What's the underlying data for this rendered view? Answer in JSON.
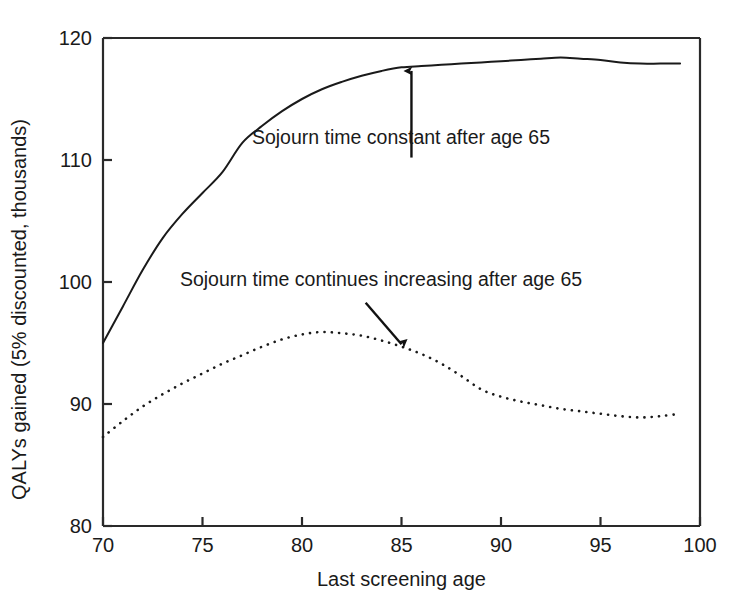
{
  "chart_data": {
    "type": "line",
    "title": "",
    "xlabel": "Last screening age",
    "ylabel": "QALYs gained (5% discounted, thousands)",
    "xlim": [
      70,
      100
    ],
    "ylim": [
      80,
      120
    ],
    "xticks": [
      70,
      75,
      80,
      85,
      90,
      95,
      100
    ],
    "yticks": [
      80,
      90,
      100,
      110,
      120
    ],
    "xtick_labels": [
      "70",
      "75",
      "80",
      "85",
      "90",
      "95",
      "100"
    ],
    "ytick_labels": [
      "80",
      "90",
      "100",
      "110",
      "120"
    ],
    "grid": false,
    "legend": "none (inline annotations with arrows)",
    "series": [
      {
        "name": "Sojourn time constant after age 65",
        "style": "solid",
        "color": "#1a1a1a",
        "x": [
          70,
          71,
          72,
          73,
          74,
          75,
          76,
          77,
          78,
          79,
          80,
          81,
          82,
          83,
          84,
          85,
          86,
          87,
          88,
          89,
          90,
          91,
          92,
          93,
          94,
          95,
          96,
          97,
          98,
          99
        ],
        "values": [
          95.0,
          98.0,
          101.0,
          103.6,
          105.6,
          107.3,
          109.0,
          111.4,
          112.8,
          114.0,
          115.0,
          115.8,
          116.4,
          116.9,
          117.3,
          117.6,
          117.7,
          117.8,
          117.9,
          118.0,
          118.1,
          118.2,
          118.3,
          118.4,
          118.3,
          118.2,
          118.0,
          117.9,
          117.9,
          117.9
        ]
      },
      {
        "name": "Sojourn time continues increasing after age 65",
        "style": "dotted",
        "color": "#1a1a1a",
        "x": [
          70,
          71,
          72,
          73,
          74,
          75,
          76,
          77,
          78,
          79,
          80,
          81,
          82,
          83,
          84,
          85,
          86,
          87,
          88,
          89,
          90,
          91,
          92,
          93,
          94,
          95,
          96,
          97,
          98,
          99
        ],
        "values": [
          87.3,
          88.6,
          89.8,
          90.8,
          91.7,
          92.5,
          93.3,
          94.0,
          94.7,
          95.3,
          95.7,
          95.9,
          95.8,
          95.6,
          95.2,
          94.7,
          94.1,
          93.3,
          92.3,
          91.2,
          90.6,
          90.2,
          89.9,
          89.6,
          89.4,
          89.2,
          89.0,
          88.9,
          89.0,
          89.2
        ]
      }
    ],
    "annotations": [
      {
        "text": "Sojourn time constant after age 65",
        "text_x": 85.5,
        "text_y": 111.6,
        "arrow_from_x": 85.5,
        "arrow_from_y": 110.2,
        "arrow_to_x": 85.5,
        "arrow_to_y": 117.3,
        "arrow_direction": "up"
      },
      {
        "text": "Sojourn time continues increasing after age 65",
        "text_x": 84.5,
        "text_y": 100.0,
        "arrow_from_x": 83.2,
        "arrow_from_y": 98.3,
        "arrow_to_x": 85.0,
        "arrow_to_y": 94.9,
        "arrow_direction": "down-right"
      }
    ]
  },
  "axis_titles": {
    "y": "QALYs gained (5% discounted, thousands)",
    "x": "Last screening age"
  },
  "colors": {
    "ink": "#1a1a1a",
    "background": "#ffffff",
    "axis": "#2a2a2a"
  }
}
